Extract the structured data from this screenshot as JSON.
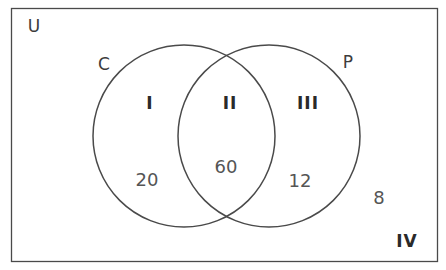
{
  "diagram": {
    "type": "venn",
    "universe_label": "U",
    "sets": [
      {
        "id": "C",
        "label": "C"
      },
      {
        "id": "P",
        "label": "P"
      }
    ],
    "regions": [
      {
        "id": "I",
        "label": "I",
        "description": "C only",
        "count": "20"
      },
      {
        "id": "II",
        "label": "II",
        "description": "C and P",
        "count": "60"
      },
      {
        "id": "III",
        "label": "III",
        "description": "P only",
        "count": "12"
      },
      {
        "id": "IV",
        "label": "IV",
        "description": "neither C nor P",
        "count": "8"
      }
    ],
    "colors": {
      "stroke": "#4a4a4a",
      "text": "#3c3c3c",
      "background": "#ffffff"
    }
  }
}
